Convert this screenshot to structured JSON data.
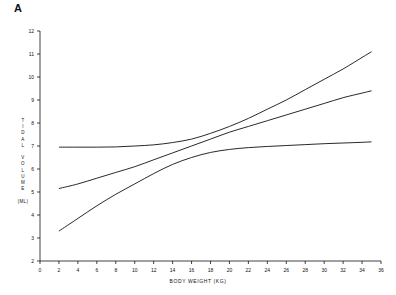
{
  "panel": {
    "label": "A"
  },
  "chart_data": {
    "type": "line",
    "title": "",
    "xlabel": "BODY WEIGHT (KG)",
    "ylabel": "TIDAL VOLUME (ML)",
    "ylabel_lines": [
      "T",
      "I",
      "D",
      "A",
      "L",
      "",
      "V",
      "O",
      "L",
      "U",
      "M",
      "E",
      "",
      "(ML)"
    ],
    "xlim": [
      0,
      36
    ],
    "ylim": [
      2,
      12
    ],
    "xticks": [
      0,
      2,
      4,
      6,
      8,
      10,
      12,
      14,
      16,
      18,
      20,
      22,
      24,
      26,
      28,
      30,
      32,
      34,
      36
    ],
    "yticks": [
      2,
      3,
      4,
      5,
      6,
      7,
      8,
      9,
      10,
      11,
      12
    ],
    "grid": false,
    "legend": "none",
    "line_color": "#111111",
    "series": [
      {
        "name": "upper",
        "x": [
          2,
          4,
          6,
          8,
          10,
          12,
          14,
          16,
          18,
          20,
          22,
          24,
          26,
          28,
          30,
          32,
          34,
          35
        ],
        "values": [
          6.95,
          6.95,
          6.95,
          6.96,
          7.0,
          7.05,
          7.15,
          7.3,
          7.55,
          7.85,
          8.2,
          8.6,
          9.0,
          9.45,
          9.9,
          10.35,
          10.85,
          11.1
        ]
      },
      {
        "name": "middle",
        "x": [
          2,
          4,
          6,
          8,
          10,
          12,
          14,
          16,
          18,
          20,
          22,
          24,
          26,
          28,
          30,
          32,
          34,
          35
        ],
        "values": [
          5.15,
          5.35,
          5.6,
          5.85,
          6.1,
          6.4,
          6.7,
          7.0,
          7.3,
          7.6,
          7.85,
          8.1,
          8.35,
          8.6,
          8.85,
          9.1,
          9.3,
          9.4
        ]
      },
      {
        "name": "lower",
        "x": [
          2,
          4,
          6,
          8,
          10,
          12,
          14,
          16,
          18,
          20,
          22,
          24,
          26,
          28,
          30,
          32,
          34,
          35
        ],
        "values": [
          3.3,
          3.85,
          4.4,
          4.9,
          5.35,
          5.8,
          6.2,
          6.5,
          6.72,
          6.85,
          6.93,
          6.98,
          7.02,
          7.06,
          7.1,
          7.13,
          7.16,
          7.18
        ]
      }
    ]
  }
}
